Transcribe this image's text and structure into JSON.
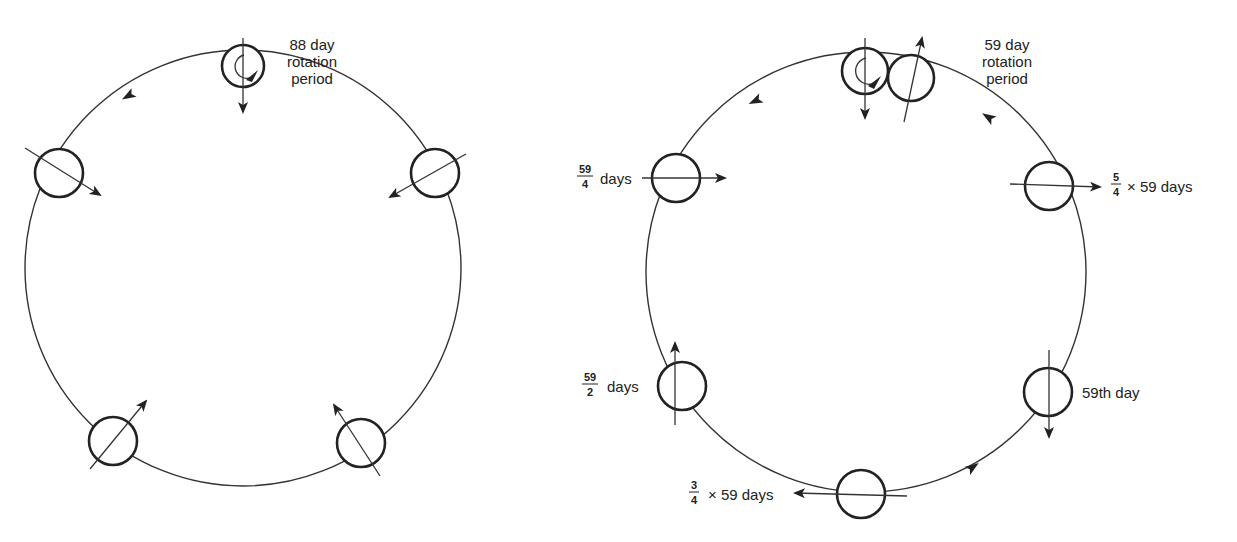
{
  "left_diagram": {
    "title_lines": [
      "88 day",
      "rotation",
      "period"
    ],
    "orbit": {
      "cx": 243,
      "cy": 268,
      "r": 218
    },
    "planets": [
      {
        "id": "top",
        "cx": 243,
        "cy": 66,
        "r": 21,
        "axis": [
          [
            243,
            38
          ],
          [
            243,
            112
          ]
        ],
        "arrow_end": "end",
        "spin_marker": true
      },
      {
        "id": "upper-left",
        "cx": 59,
        "cy": 173,
        "r": 24,
        "axis": [
          [
            25,
            148
          ],
          [
            100,
            195
          ]
        ],
        "arrow_end": "end"
      },
      {
        "id": "upper-right",
        "cx": 435,
        "cy": 173,
        "r": 24,
        "axis": [
          [
            466,
            154
          ],
          [
            390,
            197
          ]
        ],
        "arrow_end": "end"
      },
      {
        "id": "lower-left",
        "cx": 113,
        "cy": 441,
        "r": 24,
        "axis": [
          [
            90,
            469
          ],
          [
            146,
            401
          ]
        ],
        "arrow_end": "end"
      },
      {
        "id": "lower-right",
        "cx": 361,
        "cy": 443,
        "r": 24,
        "axis": [
          [
            380,
            476
          ],
          [
            334,
            405
          ]
        ],
        "arrow_end": "end"
      }
    ],
    "orbit_arrows": [
      {
        "x": 128,
        "y": 96,
        "angle": 150
      }
    ]
  },
  "right_diagram": {
    "title_lines": [
      "59 day",
      "rotation",
      "period"
    ],
    "orbit": {
      "cx": 866,
      "cy": 272,
      "r": 220
    },
    "planets": [
      {
        "id": "top",
        "cx": 865,
        "cy": 71,
        "r": 23,
        "axis": [
          [
            865,
            38
          ],
          [
            865,
            118
          ]
        ],
        "arrow_end": "end",
        "spin_marker": true
      },
      {
        "id": "top-shifted",
        "cx": 911,
        "cy": 78,
        "r": 23,
        "axis": [
          [
            904,
            122
          ],
          [
            922,
            38
          ]
        ],
        "arrow_end": "end"
      },
      {
        "id": "fifty-nine-quarter",
        "cx": 676,
        "cy": 178,
        "r": 24,
        "axis": [
          [
            642,
            178
          ],
          [
            725,
            178
          ]
        ],
        "arrow_end": "end"
      },
      {
        "id": "five-quarter",
        "cx": 1049,
        "cy": 186,
        "r": 24,
        "axis": [
          [
            1010,
            184
          ],
          [
            1100,
            187
          ]
        ],
        "arrow_end": "end"
      },
      {
        "id": "fifty-nine-half",
        "cx": 682,
        "cy": 386,
        "r": 24,
        "axis": [
          [
            675,
            425
          ],
          [
            675,
            343
          ]
        ],
        "arrow_end": "end"
      },
      {
        "id": "fifty-nine-th",
        "cx": 1048,
        "cy": 392,
        "r": 24,
        "axis": [
          [
            1049,
            350
          ],
          [
            1049,
            437
          ]
        ],
        "arrow_end": "end"
      },
      {
        "id": "three-quarter",
        "cx": 861,
        "cy": 494,
        "r": 24,
        "axis": [
          [
            907,
            496
          ],
          [
            795,
            493
          ]
        ],
        "arrow_end": "end"
      }
    ],
    "orbit_arrows": [
      {
        "x": 755,
        "y": 101,
        "angle": 155
      },
      {
        "x": 988,
        "y": 117,
        "angle": 210
      },
      {
        "x": 973,
        "y": 467,
        "angle": 325
      }
    ],
    "labels": {
      "fifty_nine_quarter": {
        "num": "59",
        "den": "4",
        "text": "days"
      },
      "five_quarter": {
        "num": "5",
        "den": "4",
        "text": "× 59 days"
      },
      "fifty_nine_half": {
        "num": "59",
        "den": "2",
        "text": "days"
      },
      "fifty_ninth_day": {
        "text": "59th day"
      },
      "three_quarter": {
        "num": "3",
        "den": "4",
        "text": "× 59 days"
      }
    }
  },
  "colors": {
    "line": "#333333",
    "planet_stroke": "#222222",
    "background": "#ffffff"
  }
}
